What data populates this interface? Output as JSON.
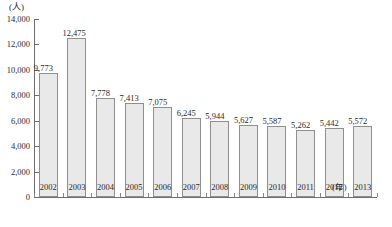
{
  "chart_data": {
    "type": "bar",
    "title": "",
    "subtitle": "",
    "xlabel": "(年)",
    "ylabel": "(人)",
    "categories": [
      "2002",
      "2003",
      "2004",
      "2005",
      "2006",
      "2007",
      "2008",
      "2009",
      "2010",
      "2011",
      "2012",
      "2013"
    ],
    "values": [
      9773,
      12475,
      7778,
      7413,
      7075,
      6245,
      5944,
      5627,
      5587,
      5262,
      5442,
      5572
    ],
    "value_labels": [
      "9,773",
      "12,475",
      "7,778",
      "7,413",
      "7,075",
      "6,245",
      "5,944",
      "5,627",
      "5,587",
      "5,262",
      "5,442",
      "5,572"
    ],
    "ylim": [
      0,
      14000
    ],
    "ytick_values": [
      0,
      2000,
      4000,
      6000,
      8000,
      10000,
      12000,
      14000
    ],
    "ytick_labels": [
      "0",
      "2,000",
      "4,000",
      "6,000",
      "8,000",
      "10,000",
      "12,000",
      "14,000"
    ],
    "grid": false,
    "legend": null,
    "bar_color": "#e9e9e9",
    "bar_border_color": "#8f8f8f",
    "axis_color": "#6e6e6e",
    "text_color": "#2b2b2b"
  }
}
